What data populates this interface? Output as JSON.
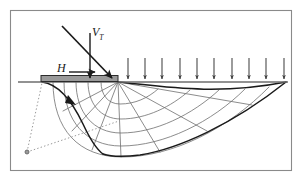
{
  "figure": {
    "name": "bearing-capacity-log-spiral-failure-mechanism",
    "domain": "Diagram",
    "width": 303,
    "height": 181,
    "background": "#ffffff",
    "frame": {
      "name": "figure-border",
      "x": 10,
      "y": 10,
      "width": 282,
      "height": 161,
      "stroke": "#8a8a8a",
      "stroke_width": 1.1,
      "fill": "none"
    }
  },
  "colors": {
    "ink": "#1a1a1a",
    "mesh": "#6e6e6e",
    "ground": "#6e6e6e",
    "plate_fill": "#9a9a9a",
    "plate_stroke": "#2b2b2b",
    "dotted": "#8c8c8c",
    "frame": "#8a8a8a",
    "white": "#ffffff"
  },
  "labels": [
    {
      "id": "vt",
      "base": "V",
      "sub": "T",
      "x": 92,
      "y": 26,
      "italic": true
    },
    {
      "id": "h",
      "base": "H",
      "sub": "",
      "x": 57,
      "y": 62,
      "italic": true
    }
  ],
  "ground_line": {
    "name": "ground-surface-line",
    "x1": 18,
    "y1": 82,
    "x2": 288,
    "y2": 82,
    "stroke": "#6e6e6e",
    "stroke_width": 1.4
  },
  "footing": {
    "name": "strip-footing-plate",
    "x": 41,
    "y": 76,
    "width": 77,
    "height": 6,
    "fill": "#9a9a9a",
    "stroke": "#2b2b2b",
    "stroke_width": 1.0
  },
  "load_vectors": [
    {
      "name": "inclined-resultant-load-arrow",
      "label_ref": "vt",
      "x1": 62,
      "y1": 26,
      "x2": 113,
      "y2": 79,
      "stroke": "#1a1a1a",
      "stroke_width": 1.6,
      "head": "solid"
    },
    {
      "name": "vertical-load-arrow",
      "label_ref": "vt",
      "x1": 90,
      "y1": 32,
      "x2": 90,
      "y2": 79,
      "stroke": "#1a1a1a",
      "stroke_width": 1.4,
      "head": "solid"
    },
    {
      "name": "horizontal-load-arrow",
      "label_ref": "h",
      "x1": 69,
      "y1": 72,
      "x2": 96,
      "y2": 72,
      "stroke": "#1a1a1a",
      "stroke_width": 1.4,
      "head": "solid"
    }
  ],
  "surcharge": {
    "name": "surcharge-arrow-row",
    "count": 10,
    "x_start": 128,
    "x_end": 284,
    "y_top": 58,
    "y_tip": 81,
    "stroke": "#4a4a4a",
    "stroke_width": 1.1,
    "x_positions": [
      128,
      145,
      162,
      180,
      197,
      214,
      232,
      249,
      266,
      284
    ]
  },
  "fan": {
    "name": "radial-shear-fan",
    "apex_x": 118,
    "apex_y": 82,
    "ray_count": 7,
    "arc_count": 5,
    "stroke": "#6e6e6e",
    "stroke_width": 0.8
  },
  "failure_surface": {
    "name": "log-spiral-failure-surface",
    "stroke": "#1a1a1a",
    "stroke_width": 1.5,
    "active_wedge_left_x": 41,
    "spiral_toe_x": 286,
    "spiral_bottom_y": 156
  },
  "rotation_indicator": {
    "name": "rotation-direction-arrowhead",
    "x": 68,
    "y": 99,
    "angle_deg": 55,
    "fill": "#1a1a1a"
  },
  "pivot": {
    "name": "rotation-centre-point",
    "cx": 27,
    "cy": 152,
    "r": 2.0,
    "fill": "#8c8c8c",
    "stroke": "#5a5a5a"
  },
  "dotted_radii": [
    {
      "name": "dotted-radius-to-footing-heel",
      "x1": 27,
      "y1": 152,
      "x2": 42,
      "y2": 83
    },
    {
      "name": "dotted-radius-to-spiral-centre",
      "x1": 27,
      "y1": 152,
      "x2": 119,
      "y2": 121
    }
  ],
  "dash_pattern": "1.4 2.2"
}
